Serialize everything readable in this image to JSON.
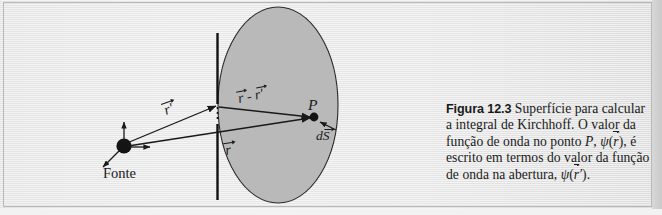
{
  "figure": {
    "number": "Figura 12.3",
    "caption_text": " Superfície para calcular a integral de Kirchhoff. O valor da função de onda no ponto P, ψ(r⃗), é escrito em termos do valor da função de onda na abertura, ψ(r⃗').",
    "caption_lines": [
      "Superfície para calcular",
      "a integral de Kirchhoff. O valor da",
      "função de onda no ponto P, ψ(r⃗), é",
      "escrito em termos do valor da fun-",
      "ção de onda na abertura, ψ(r⃗')."
    ],
    "language": "pt-BR"
  },
  "diagram": {
    "source_label": "Fonte",
    "point_label": "P",
    "vector_r_prime_label": "r'",
    "vector_r_label": "r",
    "vector_difference_label": "r - r'",
    "area_element_label": "dS",
    "elements": {
      "surface_name": "elliptical integration surface",
      "barrier_name": "aperture screen",
      "aperture_name": "aperture gap"
    }
  },
  "colors": {
    "page_background": "#e9e9e9",
    "surface_fill": "#b8b8b8",
    "ink": "#1a1a1a",
    "frame_border": "#b9b9b9",
    "right_band": "#c9c9c9"
  }
}
